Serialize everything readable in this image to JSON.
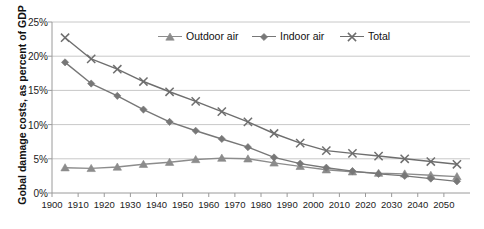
{
  "chart_data": {
    "type": "line",
    "title": "",
    "subtitle": "",
    "xlabel": "",
    "ylabel": "Gobal damage costs, as percent of GDP",
    "x": [
      1905,
      1915,
      1925,
      1935,
      1945,
      1955,
      1965,
      1975,
      1985,
      1995,
      2005,
      2015,
      2025,
      2035,
      2045,
      2055
    ],
    "xlim": [
      1900,
      2060
    ],
    "ylim": [
      0,
      25
    ],
    "xticks": [
      "1900",
      "1910",
      "1920",
      "1930",
      "1940",
      "1950",
      "1960",
      "1970",
      "1980",
      "1990",
      "2000",
      "2010",
      "2020",
      "2030",
      "2040",
      "2050"
    ],
    "xtick_values": [
      1900,
      1910,
      1920,
      1930,
      1940,
      1950,
      1960,
      1970,
      1980,
      1990,
      2000,
      2010,
      2020,
      2030,
      2040,
      2050
    ],
    "yticks": [
      "0%",
      "5%",
      "10%",
      "15%",
      "20%",
      "25%"
    ],
    "ytick_values": [
      0,
      5,
      10,
      15,
      20,
      25
    ],
    "grid": "horizontal",
    "legend_position": "top-center-inside",
    "series": [
      {
        "name": "Outdoor air",
        "marker": "triangle",
        "color": "#8c8c8c",
        "values": [
          3.7,
          3.6,
          3.8,
          4.2,
          4.5,
          4.9,
          5.1,
          5.0,
          4.4,
          3.9,
          3.4,
          3.1,
          2.9,
          2.8,
          2.6,
          2.4
        ]
      },
      {
        "name": "Indoor air",
        "marker": "diamond",
        "color": "#777777",
        "values": [
          19.1,
          16.0,
          14.2,
          12.2,
          10.4,
          9.1,
          7.9,
          6.7,
          5.2,
          4.3,
          3.7,
          3.2,
          2.8,
          2.5,
          2.1,
          1.7
        ]
      },
      {
        "name": "Total",
        "marker": "cross",
        "color": "#6e6e6e",
        "values": [
          22.7,
          19.6,
          18.1,
          16.3,
          14.8,
          13.4,
          11.9,
          10.4,
          8.7,
          7.3,
          6.2,
          5.8,
          5.4,
          5.0,
          4.6,
          4.2
        ]
      }
    ]
  },
  "axis": {
    "y_title": "Gobal damage costs, as percent of GDP"
  },
  "legend": {
    "items": [
      {
        "label": "Outdoor air",
        "marker": "triangle-marker-icon"
      },
      {
        "label": "Indoor air",
        "marker": "diamond-marker-icon"
      },
      {
        "label": "Total",
        "marker": "cross-marker-icon"
      }
    ]
  },
  "colors": {
    "series_outdoor": "#8c8c8c",
    "series_indoor": "#777777",
    "series_total": "#6e6e6e",
    "gridline": "#c8c8c8",
    "axis": "#9a9a9a",
    "text": "#222222",
    "background": "#ffffff"
  }
}
